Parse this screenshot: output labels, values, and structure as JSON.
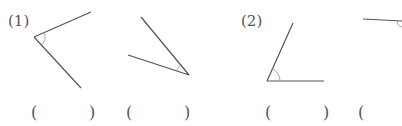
{
  "problems": [
    {
      "label": "(1)",
      "angles": [
        {
          "vertex": [
            34,
            37
          ],
          "ray_a": [
            91,
            12
          ],
          "ray_b": [
            81,
            88
          ],
          "arc_r": 11
        },
        {
          "vertex": [
            189,
            75
          ],
          "ray_a": [
            141,
            17
          ],
          "ray_b": [
            128,
            55
          ],
          "arc_r": 13
        }
      ]
    },
    {
      "label": "(2)",
      "angles": [
        {
          "vertex": [
            267,
            81
          ],
          "ray_a": [
            293,
            23
          ],
          "ray_b": [
            324,
            81
          ],
          "arc_r": 13
        },
        {
          "vertex": [
            402,
            21
          ],
          "ray_a": [
            363,
            19
          ],
          "ray_b": [
            402,
            30
          ],
          "arc_r": 6,
          "cropped": true
        }
      ]
    }
  ],
  "answer_blanks": [
    {
      "open": "(",
      "close": ")"
    },
    {
      "open": "(",
      "close": ")"
    },
    {
      "open": "(",
      "close": ")"
    },
    {
      "open": "(",
      "close": ""
    }
  ],
  "colors": {
    "line": "#555555",
    "arc": "#9a9a9a"
  }
}
